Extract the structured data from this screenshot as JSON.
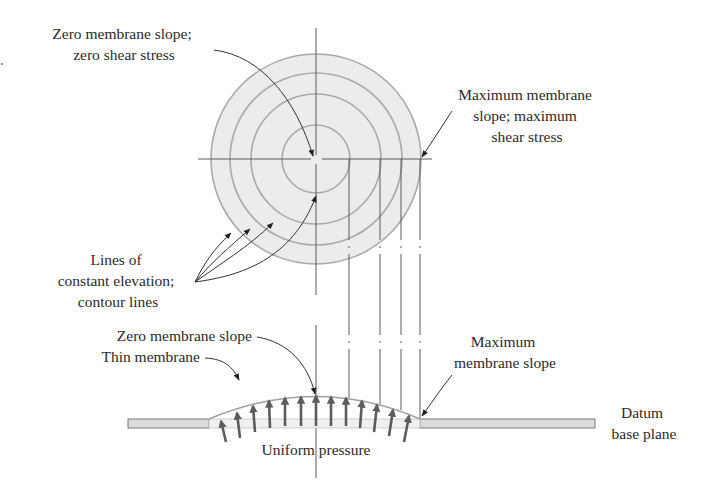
{
  "figure": {
    "top_view": {
      "label_center": [
        "Zero membrane slope;",
        "zero shear stress"
      ],
      "label_edge": [
        "Maximum membrane",
        "slope; maximum",
        "shear stress"
      ],
      "label_contours": [
        "Lines of",
        "constant elevation;",
        "contour lines"
      ],
      "contour_count": 4,
      "fill_color": "#ececec",
      "contour_color": "#a9a9a9"
    },
    "side_view": {
      "label_zero_slope": "Zero membrane slope",
      "label_thin_membrane": "Thin membrane",
      "label_max_slope": [
        "Maximum",
        "membrane slope"
      ],
      "label_pressure": "Uniform pressure",
      "label_datum": [
        "Datum",
        "base plane"
      ],
      "pressure_arrow_count": 13,
      "arrow_color": "#5c5c5c",
      "plate_color": "#dcdcdc"
    }
  }
}
